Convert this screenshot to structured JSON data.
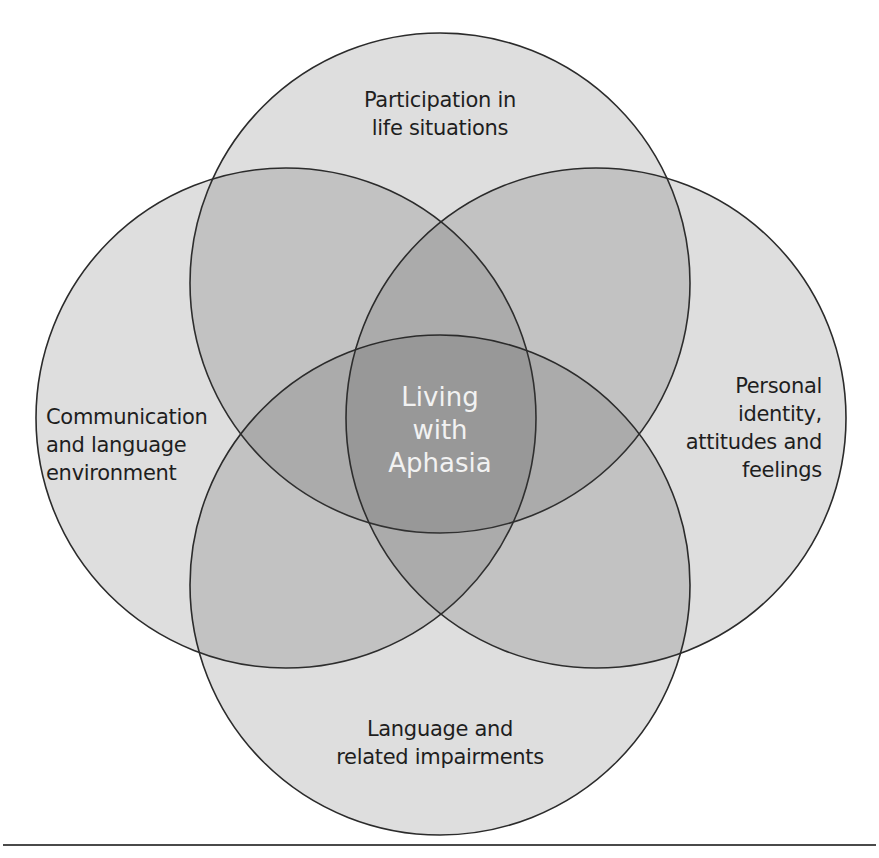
{
  "diagram": {
    "type": "venn",
    "center": {
      "label": "Living with Aphasia",
      "lines": [
        "Living",
        "with",
        "Aphasia"
      ],
      "text_color": "#f2f2f2"
    },
    "circles": [
      {
        "id": "top",
        "label": "Participation in life situations",
        "lines": [
          "Participation in",
          "life situations"
        ],
        "cx": 440,
        "cy": 283,
        "r": 250
      },
      {
        "id": "left",
        "label": "Communication and language environment",
        "lines": [
          "Communication",
          "and language",
          "environment"
        ],
        "cx": 286,
        "cy": 418,
        "r": 250
      },
      {
        "id": "right",
        "label": "Personal identity, attitudes and feelings",
        "lines": [
          "Personal",
          "identity,",
          "attitudes and",
          "feelings"
        ],
        "cx": 596,
        "cy": 418,
        "r": 250
      },
      {
        "id": "bottom",
        "label": "Language and related impairments",
        "lines": [
          "Language and",
          "related impairments"
        ],
        "cx": 440,
        "cy": 585,
        "r": 250
      }
    ],
    "colors": {
      "stroke": "#2b2b2b",
      "single_overlap": "#dedede",
      "double_overlap": "#c6c6c6",
      "triple_overlap": "#a9a9a9",
      "center_overlap": "#8e8e8e",
      "rule": "#4a4a4a"
    }
  }
}
